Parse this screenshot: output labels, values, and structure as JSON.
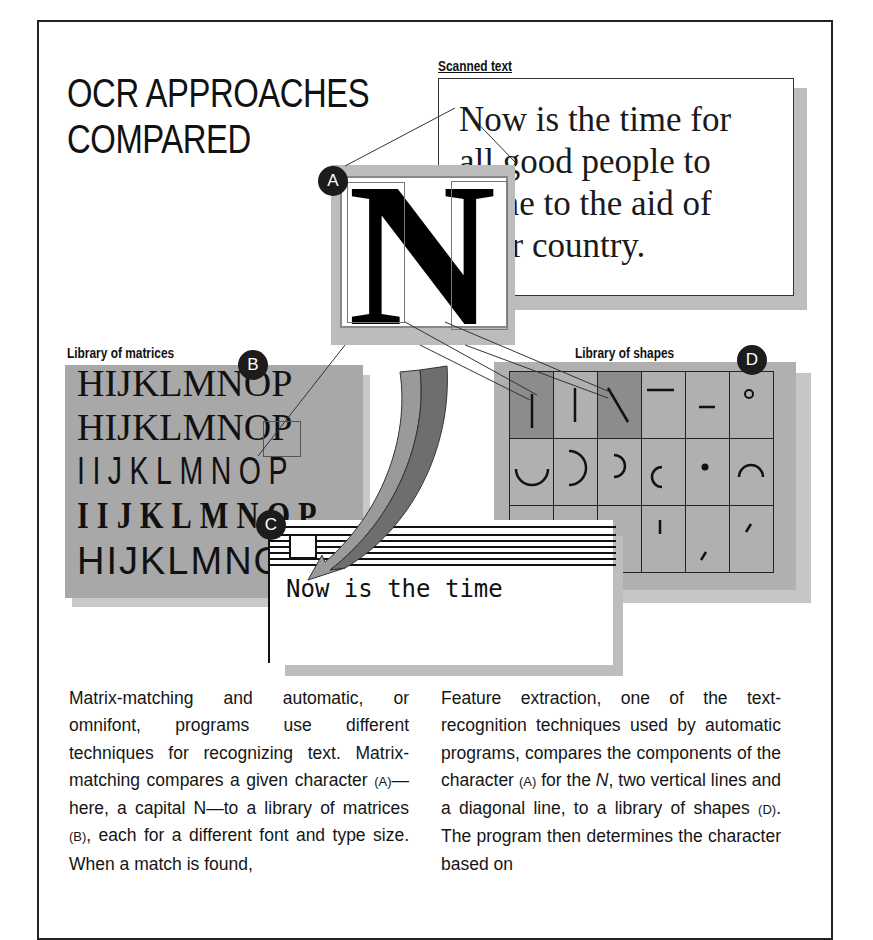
{
  "title": "OCR APPROACHES\nCOMPARED",
  "labels": {
    "scanned_text": "Scanned text",
    "library_of_matrices": "Library of matrices",
    "library_of_shapes": "Library of shapes"
  },
  "badges": {
    "a": "A",
    "b": "B",
    "c": "C",
    "d": "D"
  },
  "scanned_text": {
    "lines": [
      "Now is the time for",
      "all good people to",
      "come to the aid of",
      "their country."
    ]
  },
  "character_sample": {
    "glyph": "N"
  },
  "matrices": {
    "rows": [
      "HIJKLMNOP",
      "HIJKLMNOP",
      "IIJKLMNOP",
      "IIJKLMNOP",
      "HIJKLMNOP"
    ],
    "highlighted": "N"
  },
  "shapes": {
    "rows": [
      [
        "vertical-line-matched",
        "vertical-line",
        "diagonal-line-matched",
        "horizontal-line-high",
        "horizontal-line-low",
        "small-circle"
      ],
      [
        "bottom-arc",
        "right-arc-large",
        "right-arc-small",
        "left-arc",
        "dot",
        "top-arc"
      ],
      [
        "",
        "",
        "",
        "short-vertical",
        "low-slash",
        "high-slash"
      ]
    ]
  },
  "output_window": {
    "text": "Now is the time"
  },
  "body_text": {
    "left": {
      "parts": [
        "Matrix-matching and automatic, or omnifont, programs use different techniques for recognizing text. Matrix-matching compares a given character ",
        "(A)",
        "—here, a capital N—to a library of matrices ",
        "(B)",
        ", each for a different font and type size. When a match is found,"
      ]
    },
    "right": {
      "parts": [
        "Feature extraction, one of the text-recognition techniques used by automatic programs, compares the components of the character ",
        "(A)",
        " for the ",
        "N",
        ", two vertical lines and a diagonal line, to a library of shapes ",
        "(D)",
        ". The program then determines the character based on"
      ]
    }
  },
  "colors": {
    "ink": "#111111",
    "panel_gray": "#a8a8a8",
    "shadow_gray": "#bdbdbd",
    "match_gray": "#8c8c8c"
  }
}
